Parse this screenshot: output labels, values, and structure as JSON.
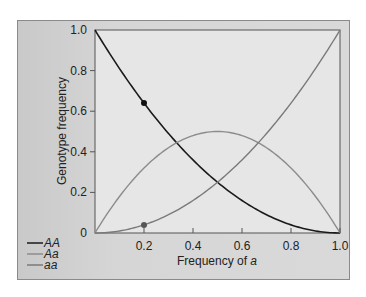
{
  "chart_data": {
    "type": "line",
    "title": "",
    "xlabel": "Frequency of a",
    "xlabel_plain": "Frequency of ",
    "xlabel_italic": "a",
    "ylabel": "Genotype frequency",
    "xlim": [
      0,
      1.0
    ],
    "ylim": [
      0,
      1.0
    ],
    "x_ticks": [
      "0.2",
      "0.4",
      "0.6",
      "0.8",
      "1.0"
    ],
    "y_ticks": [
      "0",
      "0.2",
      "0.4",
      "0.6",
      "0.8",
      "1.0"
    ],
    "grid": false,
    "legend_position": "bottom-left",
    "series": [
      {
        "name": "AA",
        "formula": "(1-q)^2",
        "color": "#1a1a1a",
        "x": [
          0,
          0.2,
          0.4,
          0.5,
          0.6,
          0.8,
          1.0
        ],
        "values": [
          1.0,
          0.64,
          0.36,
          0.25,
          0.16,
          0.04,
          0
        ]
      },
      {
        "name": "Aa",
        "formula": "2q(1-q)",
        "color": "#8c8c8c",
        "x": [
          0,
          0.2,
          0.4,
          0.5,
          0.6,
          0.8,
          1.0
        ],
        "values": [
          0,
          0.32,
          0.48,
          0.5,
          0.48,
          0.32,
          0
        ]
      },
      {
        "name": "aa",
        "formula": "q^2",
        "color": "#7a7a7a",
        "x": [
          0,
          0.2,
          0.4,
          0.5,
          0.6,
          0.8,
          1.0
        ],
        "values": [
          0,
          0.04,
          0.16,
          0.25,
          0.36,
          0.64,
          1.0
        ]
      }
    ],
    "annotations": [
      {
        "type": "point",
        "series": "AA",
        "x": 0.2,
        "y": 0.64,
        "color": "#111111"
      },
      {
        "type": "point",
        "series": "aa",
        "x": 0.2,
        "y": 0.04,
        "color": "#555555"
      }
    ]
  }
}
